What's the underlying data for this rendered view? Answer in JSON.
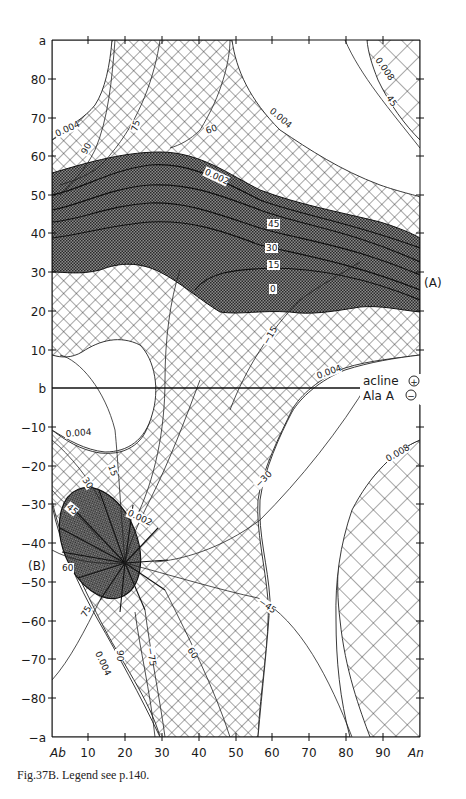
{
  "figure": {
    "caption": "Fig.37B.  Legend see p.140.",
    "x_axis": {
      "left_label": "Ab",
      "right_label": "An",
      "ticks": [
        "10",
        "20",
        "30",
        "40",
        "50",
        "60",
        "70",
        "80",
        "90"
      ]
    },
    "y_axis": {
      "top_label": "a",
      "bottom_label": "−a",
      "middle_label": "b",
      "ticks_upper": [
        "80",
        "70",
        "60",
        "50",
        "40",
        "30",
        "20",
        "10"
      ],
      "ticks_lower": [
        "−10",
        "−20",
        "−30",
        "−40",
        "−50",
        "−60",
        "−70",
        "−80"
      ]
    },
    "region_labels": {
      "A": "(A)",
      "B": "(B)"
    },
    "legend": {
      "upper": "acline",
      "upper_sign": "+",
      "lower": "Ala A",
      "lower_sign": "−"
    },
    "contour_labels": {
      "c_0004_tl": "0.004",
      "c_90_top": "90",
      "c_75_top": "75",
      "c_60_top": "60",
      "c_0004_tr": "0.004",
      "c_0008_tr": "0.008",
      "c_45_tr": "45",
      "c_0002_a": "0.002",
      "c_45_a": "45",
      "c_30_a": "30",
      "c_15_a": "15",
      "c_0_a": "0",
      "c_m15": "−15",
      "c_0004_mid": "0.004",
      "c_0004_bl": "0.004",
      "c_15_b": "15",
      "c_30_b": "30",
      "c_45_b": "45",
      "c_0002_b": "0.002",
      "c_60_b": "60",
      "c_m30": "−30",
      "c_0008_br": "0.008",
      "c_75_bl": "75",
      "c_0004_bot": "0.004",
      "c_90_bot": "90",
      "c_m75_bot": "−75",
      "c_60_bot": "60",
      "c_m45": "−45"
    }
  }
}
